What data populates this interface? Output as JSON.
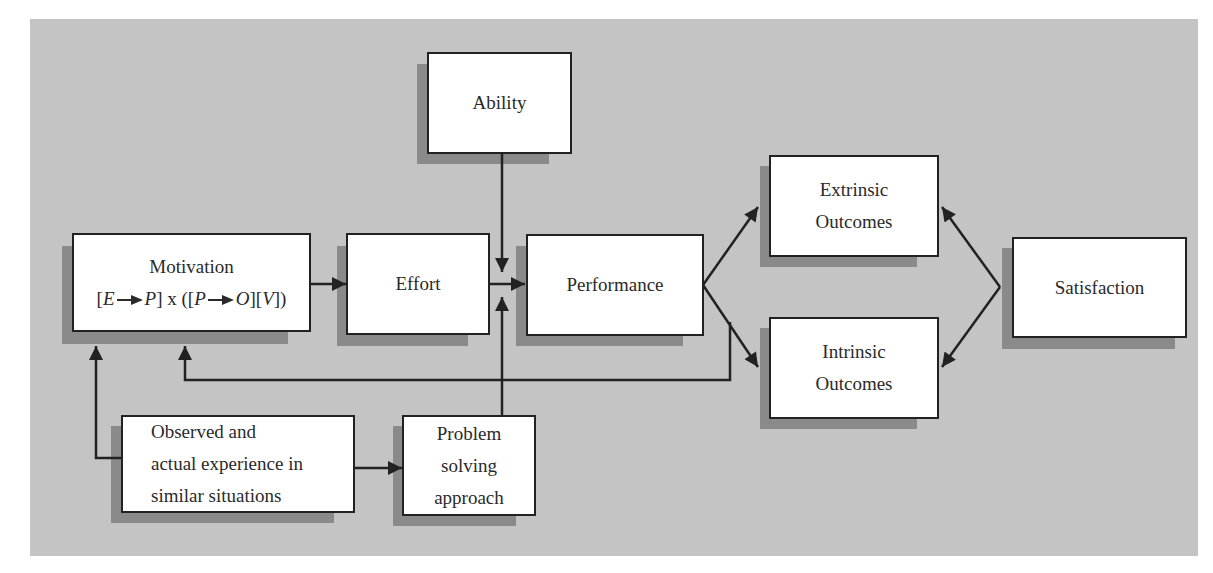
{
  "diagram": {
    "title": "",
    "nodes": {
      "ability": {
        "label": "Ability"
      },
      "motivation": {
        "label": "Motivation",
        "formula": {
          "open1": "[",
          "E": "E",
          "P1": "P",
          "close1": "] x ([",
          "P2": "P",
          "O": "O",
          "close2": "][",
          "V": "V",
          "close3": "])"
        }
      },
      "effort": {
        "label": "Effort"
      },
      "performance": {
        "label": "Performance"
      },
      "extrinsic": {
        "line1": "Extrinsic",
        "line2": "Outcomes"
      },
      "intrinsic": {
        "line1": "Intrinsic",
        "line2": "Outcomes"
      },
      "satisfaction": {
        "label": "Satisfaction"
      },
      "observed": {
        "line1": "Observed and",
        "line2": "actual experience in",
        "line3": "similar situations"
      },
      "problem": {
        "line1": "Problem",
        "line2": "solving",
        "line3": "approach"
      }
    },
    "edges": [
      {
        "from": "motivation",
        "to": "effort"
      },
      {
        "from": "effort",
        "to": "performance"
      },
      {
        "from": "ability",
        "to": "performance"
      },
      {
        "from": "problem",
        "to": "performance"
      },
      {
        "from": "performance",
        "to": "extrinsic"
      },
      {
        "from": "performance",
        "to": "intrinsic"
      },
      {
        "from": "satisfaction",
        "to": "extrinsic"
      },
      {
        "from": "satisfaction",
        "to": "intrinsic"
      },
      {
        "from": "outcomes",
        "to": "motivation",
        "type": "feedback"
      },
      {
        "from": "observed",
        "to": "motivation"
      },
      {
        "from": "observed",
        "to": "problem"
      }
    ],
    "colors": {
      "background": "#c4c4c4",
      "box_fill": "#ffffff",
      "shadow": "#8a8a8a",
      "line": "#222222"
    }
  }
}
